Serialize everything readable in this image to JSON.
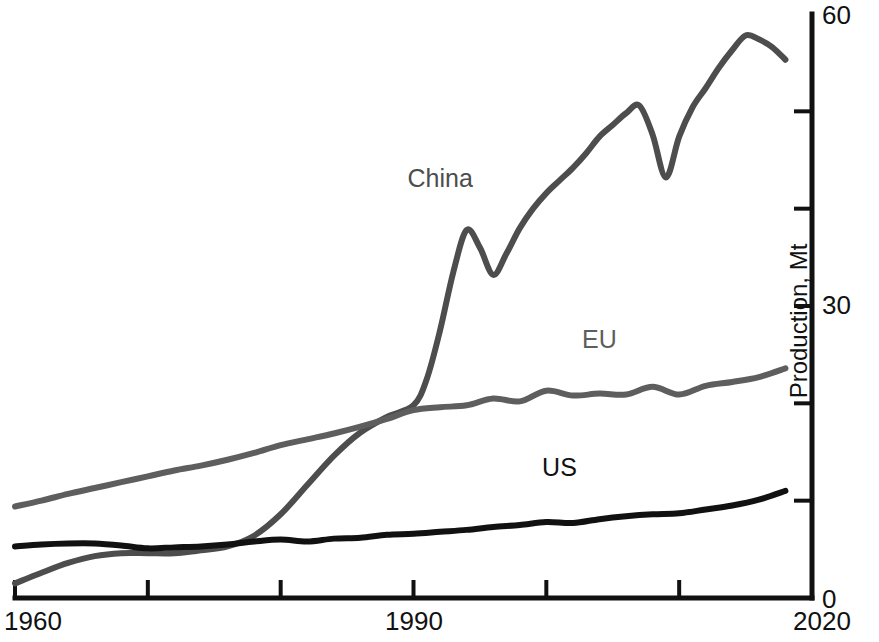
{
  "chart_data": {
    "type": "line",
    "title": "",
    "xlabel": "",
    "ylabel": "Production, Mt",
    "xlim": [
      1960,
      2020
    ],
    "ylim": [
      0,
      60
    ],
    "grid": false,
    "legend_position": "inline-labels",
    "x_ticks": [
      1960,
      1970,
      1980,
      1990,
      2000,
      2010,
      2020
    ],
    "x_tick_labels": [
      "1960",
      "",
      "",
      "1990",
      "",
      "",
      "2020"
    ],
    "y_ticks": [
      0,
      10,
      20,
      30,
      40,
      50,
      60
    ],
    "y_tick_labels": [
      "0",
      "",
      "",
      "30",
      "",
      "",
      "60"
    ],
    "y_axis_side": "right",
    "series": [
      {
        "name": "China",
        "color": "#4d4d4d",
        "x": [
          1960,
          1962,
          1964,
          1966,
          1968,
          1970,
          1972,
          1974,
          1976,
          1978,
          1980,
          1982,
          1984,
          1986,
          1988,
          1990,
          1991,
          1992,
          1993,
          1994,
          1995,
          1996,
          1997,
          1998,
          1999,
          2000,
          2001,
          2002,
          2003,
          2004,
          2005,
          2006,
          2007,
          2008,
          2009,
          2010,
          2011,
          2012,
          2013,
          2014,
          2015,
          2016,
          2017,
          2018
        ],
        "values": [
          1.5,
          2.6,
          3.6,
          4.3,
          4.6,
          4.6,
          4.6,
          4.9,
          5.3,
          6.4,
          8.6,
          11.6,
          14.6,
          17.0,
          18.6,
          19.8,
          22.5,
          27.5,
          33.5,
          37.8,
          36.0,
          33.2,
          35.4,
          38.0,
          40.0,
          41.6,
          42.9,
          44.2,
          45.7,
          47.4,
          48.6,
          49.8,
          50.6,
          47.6,
          43.2,
          47.4,
          50.4,
          52.4,
          54.5,
          56.3,
          57.8,
          57.4,
          56.6,
          55.3
        ]
      },
      {
        "name": "EU",
        "color": "#5e5e5e",
        "x": [
          1960,
          1962,
          1964,
          1966,
          1968,
          1970,
          1972,
          1974,
          1976,
          1978,
          1980,
          1982,
          1984,
          1986,
          1988,
          1990,
          1992,
          1994,
          1996,
          1998,
          2000,
          2002,
          2004,
          2006,
          2008,
          2010,
          2012,
          2014,
          2016,
          2018
        ],
        "values": [
          9.4,
          10.0,
          10.7,
          11.3,
          11.9,
          12.5,
          13.1,
          13.6,
          14.2,
          14.9,
          15.7,
          16.3,
          16.9,
          17.6,
          18.4,
          19.3,
          19.6,
          19.8,
          20.5,
          20.2,
          21.3,
          20.8,
          21.0,
          20.9,
          21.7,
          20.9,
          21.8,
          22.2,
          22.7,
          23.6
        ]
      },
      {
        "name": "US",
        "color": "#111111",
        "x": [
          1960,
          1962,
          1964,
          1966,
          1968,
          1970,
          1972,
          1974,
          1976,
          1978,
          1980,
          1982,
          1984,
          1986,
          1988,
          1990,
          1992,
          1994,
          1996,
          1998,
          2000,
          2002,
          2004,
          2006,
          2008,
          2010,
          2012,
          2014,
          2016,
          2018
        ],
        "values": [
          5.3,
          5.5,
          5.6,
          5.6,
          5.4,
          5.1,
          5.2,
          5.3,
          5.5,
          5.8,
          6.0,
          5.8,
          6.1,
          6.2,
          6.5,
          6.6,
          6.8,
          7.0,
          7.3,
          7.5,
          7.8,
          7.7,
          8.1,
          8.4,
          8.6,
          8.7,
          9.1,
          9.5,
          10.1,
          11.0
        ]
      }
    ],
    "annotations": [
      {
        "text": "China",
        "x": 1992,
        "y": 43
      },
      {
        "text": "EU",
        "x": 2004,
        "y": 26.5
      },
      {
        "text": "US",
        "x": 2001,
        "y": 13.4
      }
    ]
  },
  "axis": {
    "x_min_label": "1960",
    "x_mid_label": "1990",
    "x_max_label": "2020",
    "y_min_label": "0",
    "y_mid_label": "30",
    "y_max_label": "60",
    "y_title": "Production, Mt"
  },
  "labels": {
    "china": "China",
    "eu": "EU",
    "us": "US"
  },
  "colors": {
    "china": "#4d4d4d",
    "eu": "#5e5e5e",
    "us": "#111111",
    "axis": "#111111",
    "background": "#ffffff"
  }
}
